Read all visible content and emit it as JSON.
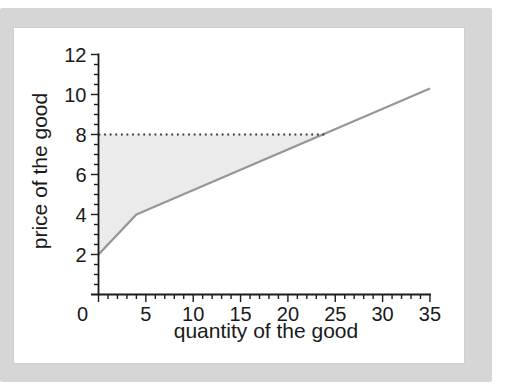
{
  "page": {
    "background_color": "#ffffff",
    "backdrop_color": "#d6d6d6",
    "card_color": "#ffffff"
  },
  "chart_data": {
    "type": "line",
    "title": "",
    "xlabel": "quantity of the good",
    "ylabel": "price of the good",
    "xlim": [
      0,
      35
    ],
    "ylim": [
      0,
      12
    ],
    "x_major_ticks": [
      0,
      5,
      10,
      15,
      20,
      25,
      30,
      35
    ],
    "x_minor_step": 1,
    "y_major_ticks": [
      2,
      4,
      6,
      8,
      10,
      12
    ],
    "y_minor_step": 0.5,
    "grid": false,
    "legend": false,
    "series": [
      {
        "name": "supply-curve",
        "style": "solid",
        "color": "#979797",
        "points": [
          [
            0,
            2
          ],
          [
            4,
            4
          ],
          [
            35,
            10.3
          ]
        ]
      },
      {
        "name": "reference-price-line",
        "style": "dotted",
        "color": "#333333",
        "points": [
          [
            0,
            8
          ],
          [
            24,
            8
          ]
        ]
      }
    ],
    "shaded_region": {
      "name": "producer-surplus-region",
      "fill": "#ebebeb",
      "points": [
        [
          0,
          2
        ],
        [
          0,
          8
        ],
        [
          24,
          8
        ],
        [
          4,
          4
        ]
      ]
    },
    "axis_color": "#1a1a1a",
    "intersection_point": {
      "x": 24,
      "y": 8
    }
  }
}
